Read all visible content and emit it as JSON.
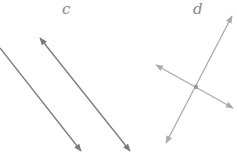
{
  "figures": [
    {
      "label": "c",
      "description": "parallel lines",
      "color": "#7a7a7a",
      "label_pos": [
        62,
        14
      ],
      "lines": [
        {
          "x1": 0,
          "y1": 48,
          "x2": 81,
          "y2": 151,
          "arrow_start": false,
          "arrow_end": true
        },
        {
          "x1": 40,
          "y1": 38,
          "x2": 130,
          "y2": 151,
          "arrow_start": true,
          "arrow_end": true
        }
      ]
    },
    {
      "label": "d",
      "description": "intersecting lines",
      "color": "#ababab",
      "label_pos": [
        193,
        14
      ],
      "intersection": [
        196,
        87
      ],
      "lines": [
        {
          "x1": 156,
          "y1": 65,
          "x2": 233,
          "y2": 108,
          "arrow_start": true,
          "arrow_end": true
        },
        {
          "x1": 232,
          "y1": 16,
          "x2": 166,
          "y2": 143,
          "arrow_start": true,
          "arrow_end": true
        }
      ]
    }
  ]
}
